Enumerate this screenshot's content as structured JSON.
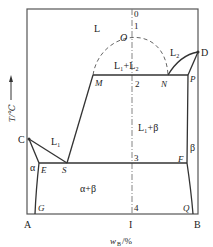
{
  "diagram": {
    "axes": {
      "y_label": "T/℃",
      "x_label": "w_B/%",
      "x_label_main": "w",
      "x_label_sub": "B",
      "x_label_unit": "/%",
      "left_component": "A",
      "right_component": "B",
      "composition_marker": "I"
    },
    "points": {
      "C": "C",
      "D": "D",
      "M": "M",
      "N": "N",
      "O": "O",
      "P": "P",
      "E": "E",
      "S": "S",
      "F": "F",
      "G": "G",
      "Q": "Q"
    },
    "regions": {
      "liquid": "L",
      "liquid_gap": "L₁+L₂",
      "l2": "L₂",
      "l1": "L₁",
      "l1_beta": "L₁+β",
      "alpha": "α",
      "beta": "β",
      "alpha_beta": "α+β"
    },
    "cooling_path_points": [
      "0",
      "1",
      "2",
      "3",
      "4"
    ],
    "colors": {
      "line": "#333333",
      "dashed": "#666666",
      "frame": "#555555"
    }
  }
}
